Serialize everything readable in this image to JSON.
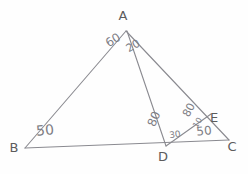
{
  "figure": {
    "stroke_color": "#8a8a90",
    "label_color": "#5c5c5c",
    "angle_color": "#7d7d84",
    "background": "#fefefe",
    "vertices": [
      {
        "name": "A",
        "label": "A",
        "x": 123,
        "y": 22
      },
      {
        "name": "B",
        "label": "B",
        "x": 14,
        "y": 147
      },
      {
        "name": "C",
        "label": "C",
        "x": 232,
        "y": 146
      },
      {
        "name": "D",
        "label": "D",
        "x": 163,
        "y": 156
      },
      {
        "name": "E",
        "label": "E",
        "x": 214,
        "y": 117
      }
    ],
    "angles": [
      {
        "name": "angle-bad",
        "value": "60",
        "at": "A",
        "x": 113,
        "y": 40
      },
      {
        "name": "angle-dac",
        "value": "20",
        "at": "A",
        "x": 132,
        "y": 45
      },
      {
        "name": "angle-abc",
        "value": "50",
        "at": "B",
        "x": 44,
        "y": 130
      },
      {
        "name": "angle-adb",
        "value": "80",
        "at": "D",
        "x": 154,
        "y": 118
      },
      {
        "name": "angle-edc",
        "value": "30",
        "at": "D",
        "x": 174,
        "y": 134
      },
      {
        "name": "angle-aed",
        "value": "80",
        "at": "E",
        "x": 188,
        "y": 110
      },
      {
        "name": "angle-dec",
        "value": "10",
        "at": "E",
        "x": 197,
        "y": 122
      },
      {
        "name": "angle-acb",
        "value": "50",
        "at": "C",
        "x": 203,
        "y": 130
      }
    ]
  }
}
